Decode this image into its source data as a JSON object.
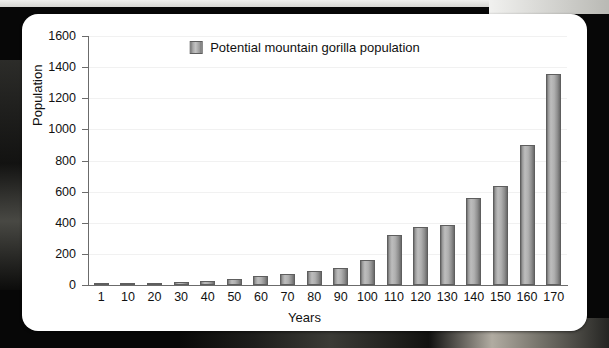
{
  "chart_data": {
    "type": "bar",
    "title": "",
    "xlabel": "Years",
    "ylabel": "Population",
    "legend": [
      "Potential mountain gorilla population"
    ],
    "legend_position": "top-center",
    "grid": true,
    "ylim": [
      0,
      1600
    ],
    "yticks": [
      0,
      200,
      400,
      600,
      800,
      1000,
      1200,
      1400,
      1600
    ],
    "ytick_labels": [
      "0",
      "200",
      "400",
      "600",
      "800",
      "1000",
      "1200",
      "1400",
      "1600"
    ],
    "categories": [
      "1",
      "10",
      "20",
      "30",
      "40",
      "50",
      "60",
      "70",
      "80",
      "90",
      "100",
      "110",
      "120",
      "130",
      "140",
      "150",
      "160",
      "170"
    ],
    "series": [
      {
        "name": "Potential mountain gorilla population",
        "values": [
          5,
          8,
          12,
          18,
          25,
          40,
          55,
          70,
          90,
          110,
          160,
          320,
          375,
          385,
          560,
          635,
          900,
          1355
        ]
      }
    ]
  },
  "colors": {
    "bar_fill": "#b0b0b0",
    "bar_edge": "#5e5e5e",
    "axis": "#6b6b6b",
    "grid": "#f1f1f1",
    "card_background": "#ffffff",
    "text": "#111111",
    "page_background": "#0b0b0b"
  }
}
